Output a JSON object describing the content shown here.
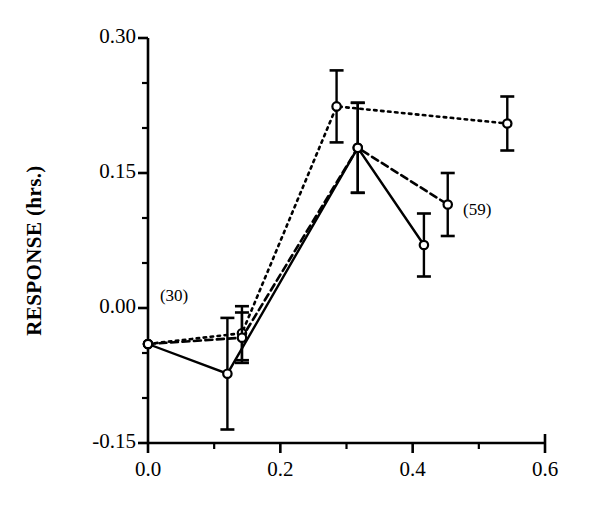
{
  "chart_data": {
    "type": "line",
    "title": "",
    "xlabel": "",
    "ylabel": "RESPONSE (hrs.)",
    "xlim": [
      0.0,
      0.6
    ],
    "ylim": [
      -0.15,
      0.3
    ],
    "grid": false,
    "legend": "none",
    "x_ticks": [
      "0.0",
      "0.2",
      "0.4",
      "0.6"
    ],
    "x_tick_values": [
      0.0,
      0.2,
      0.4,
      0.6
    ],
    "x_minor_tick_values": [
      0.1,
      0.3,
      0.5
    ],
    "y_ticks": [
      "0.30",
      "0.15",
      "0.00",
      "-0.15"
    ],
    "y_tick_values": [
      0.3,
      0.15,
      0.0,
      -0.15
    ],
    "y_minor_tick_values": [
      0.25,
      0.2,
      0.1,
      0.05,
      -0.05,
      -0.1
    ],
    "series": [
      {
        "name": "upper-dotted-series",
        "style": "dotted",
        "marker": "open-circle",
        "x": [
          0.0,
          0.142,
          0.285,
          0.543
        ],
        "y": [
          -0.04,
          -0.028,
          0.224,
          0.205
        ],
        "yerr": [
          0.0,
          0.03,
          0.04,
          0.03
        ]
      },
      {
        "name": "middle-dashed-series",
        "style": "dashed",
        "marker": "open-circle",
        "x": [
          0.0,
          0.142,
          0.317,
          0.453
        ],
        "y": [
          -0.04,
          -0.033,
          0.178,
          0.115
        ],
        "yerr": [
          0.0,
          0.028,
          0.05,
          0.035
        ]
      },
      {
        "name": "lower-solid-series",
        "style": "solid",
        "marker": "open-circle",
        "x": [
          0.0,
          0.12,
          0.317,
          0.417
        ],
        "y": [
          -0.04,
          -0.073,
          0.178,
          0.07
        ],
        "yerr": [
          0.0,
          0.062,
          0.05,
          0.035
        ]
      }
    ],
    "annotations": [
      {
        "text": "(30)",
        "x": 0.012,
        "y": 0.012
      },
      {
        "text": "(59)",
        "x": 0.47,
        "y": 0.108
      }
    ]
  },
  "axes": {
    "y_axis_title": "RESPONSE (hrs.)"
  }
}
